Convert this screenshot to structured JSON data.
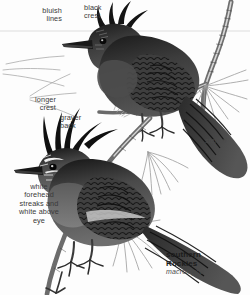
{
  "plate": {
    "title": "Steller's Jay subspecies comparison plate",
    "background_color": "#fdfdfd",
    "text_color": "#3a3a3a"
  },
  "labels": [
    {
      "id": "bluish-lines",
      "text": "bluish\nlines",
      "align": "right",
      "x": 8,
      "y": 7,
      "w": 54
    },
    {
      "id": "black-crest",
      "text": "black\ncrest",
      "align": "left",
      "x": 84,
      "y": 4,
      "w": 42
    },
    {
      "id": "longer-crest",
      "text": "longer\ncrest",
      "align": "right",
      "x": 6,
      "y": 96,
      "w": 50
    },
    {
      "id": "grayer-back",
      "text": "grayer\nback",
      "align": "left",
      "x": 60,
      "y": 114,
      "w": 44
    },
    {
      "id": "white-forehead",
      "text": "white\nforehead\nstreaks and\nwhite above\neye",
      "align": "center",
      "x": 8,
      "y": 183,
      "w": 62
    },
    {
      "id": "stelleri",
      "text": "stelleri",
      "align": "left",
      "x": 205,
      "y": 137,
      "w": 44
    }
  ],
  "range_labels": [
    {
      "id": "southern-rockies",
      "line1": "southern",
      "line2": "Rockies",
      "scientific": "macrolopha",
      "x": 166,
      "y": 250,
      "w": 80
    }
  ],
  "icons": {
    "upper_bird": "bird-steller-jay-icon",
    "lower_bird": "bird-steller-jay-icon",
    "branch": "pine-branch-icon",
    "needles": "pine-needle-cluster-icon",
    "horizon_rule": "horizontal-guide-line"
  },
  "colors": {
    "ink_dark": "#222222",
    "ink_mid": "#4f4f4f",
    "ink_light": "#8f8f8f",
    "needle": "#9a9a9a",
    "guide_line": "#c9c9c9"
  }
}
